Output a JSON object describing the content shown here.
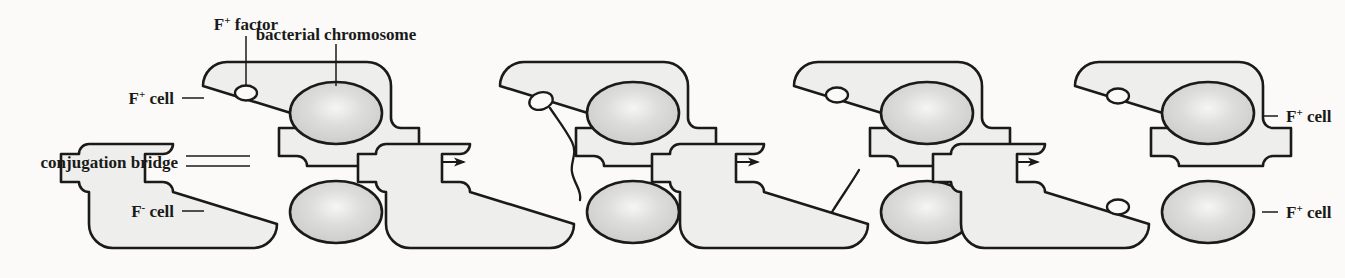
{
  "figure": {
    "background_color": "#fbfaf8",
    "ink_color": "#1a1a1a",
    "cell_fill_color": "#eeeeec",
    "chromosome_fill_color": "#d2d2d0",
    "chromosome_highlight_color": "#f2f2f0"
  },
  "labels": {
    "f_factor": {
      "base": "F",
      "sup": "+",
      "rest": " factor"
    },
    "bacterial_chromosome": "bacterial chromosome",
    "f_plus_cell": {
      "base": "F",
      "sup": "+",
      "rest": " cell"
    },
    "f_minus_cell": {
      "base": "F",
      "sup": "-",
      "rest": " cell"
    },
    "conjugation_bridge": "conjugation bridge"
  },
  "panels": [
    {
      "index": 1,
      "caption": "F-plus donor cell paired with F-minus recipient cell via conjugation bridge",
      "top_cell_label": "F+ cell",
      "bottom_cell_label": "F- cell",
      "top_cell_has_f_factor": true,
      "bottom_cell_has_f_factor": false,
      "dna_transfer_state": "none"
    },
    {
      "index": 2,
      "caption": "F factor opens and a single strand begins moving through the conjugation bridge",
      "top_cell_label": "",
      "bottom_cell_label": "",
      "top_cell_has_f_factor": true,
      "bottom_cell_has_f_factor": false,
      "dna_transfer_state": "transferring"
    },
    {
      "index": 3,
      "caption": "Transferred strand now lies in the recipient cell; donor F factor recircularizes",
      "top_cell_label": "",
      "bottom_cell_label": "",
      "top_cell_has_f_factor": true,
      "bottom_cell_has_f_factor": false,
      "dna_transfer_state": "transferred"
    },
    {
      "index": 4,
      "caption": "Both cells now carry an F factor and are F-plus",
      "top_cell_label": "F+ cell",
      "bottom_cell_label": "F+ cell",
      "top_cell_has_f_factor": true,
      "bottom_cell_has_f_factor": true,
      "dna_transfer_state": "complete"
    }
  ],
  "arrows": [
    {
      "index": 1,
      "direction": "right",
      "meaning": "next stage"
    },
    {
      "index": 2,
      "direction": "right",
      "meaning": "next stage"
    },
    {
      "index": 3,
      "direction": "right",
      "meaning": "next stage"
    }
  ]
}
